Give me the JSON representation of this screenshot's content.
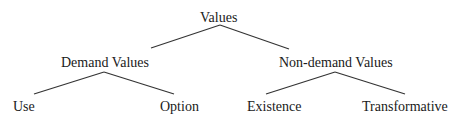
{
  "diagram": {
    "type": "tree",
    "root": {
      "label": "Values",
      "children": [
        {
          "label": "Demand Values",
          "children": [
            {
              "label": "Use"
            },
            {
              "label": "Option"
            }
          ]
        },
        {
          "label": "Non-demand Values",
          "children": [
            {
              "label": "Existence"
            },
            {
              "label": "Transformative"
            }
          ]
        }
      ]
    },
    "colors": {
      "line": "#333333",
      "text": "#1a1a1a",
      "background": "#ffffff"
    }
  }
}
